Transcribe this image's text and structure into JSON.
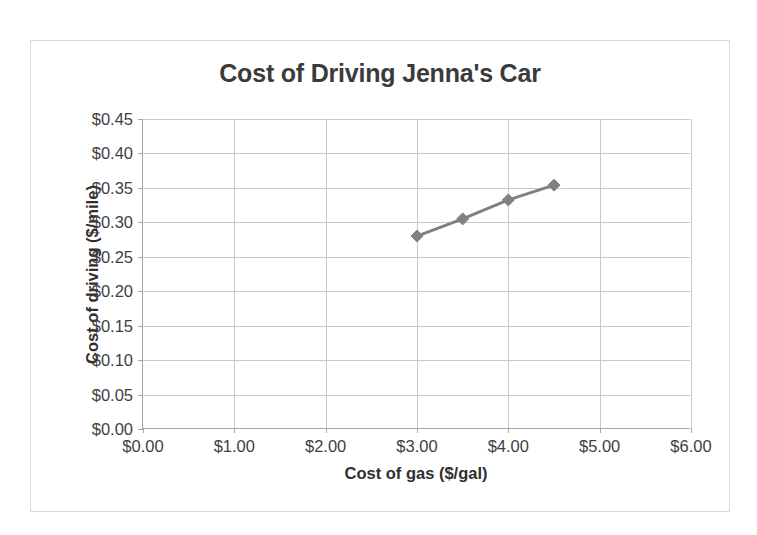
{
  "chart_data": {
    "type": "line",
    "title": "Cost of Driving Jenna's Car",
    "xlabel": "Cost of gas ($/gal)",
    "ylabel": "Cost of driving ($/mile)",
    "x": [
      3.0,
      3.5,
      4.0,
      4.5
    ],
    "values": [
      0.28,
      0.305,
      0.3325,
      0.354
    ],
    "series": [
      {
        "name": "Cost of driving",
        "x": [
          3.0,
          3.5,
          4.0,
          4.5
        ],
        "values": [
          0.28,
          0.305,
          0.3325,
          0.354
        ]
      }
    ],
    "xlim": [
      0,
      6
    ],
    "ylim": [
      0,
      0.45
    ],
    "xticks": [
      0,
      1,
      2,
      3,
      4,
      5,
      6
    ],
    "yticks": [
      0,
      0.05,
      0.1,
      0.15,
      0.2,
      0.25,
      0.3,
      0.35,
      0.4,
      0.45
    ],
    "xticklabels": [
      "$0.00",
      "$1.00",
      "$2.00",
      "$3.00",
      "$4.00",
      "$5.00",
      "$6.00"
    ],
    "yticklabels": [
      "$0.00",
      "$0.05",
      "$0.10",
      "$0.15",
      "$0.20",
      "$0.25",
      "$0.30",
      "$0.35",
      "$0.40",
      "$0.45"
    ],
    "grid": "both",
    "legend": "none",
    "marker": "diamond",
    "series_color": "#808080",
    "grid_color": "#c9c9c9",
    "axis_color": "#a6a6a6",
    "title_color": "#3b3b3b",
    "text_color": "#3f3f3f",
    "background": "#ffffff",
    "frame_border_color": "#d9d9d9"
  }
}
